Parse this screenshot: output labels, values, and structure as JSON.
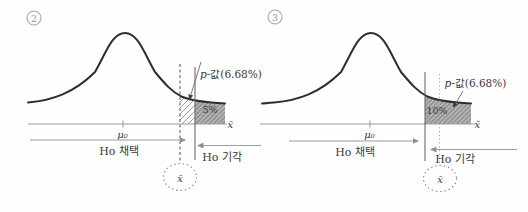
{
  "figure": {
    "colors": {
      "curve": "#2e2e2e",
      "axis_grey": "#9c9c9c",
      "region_fill_grey": "#b6b6b6",
      "region_hatch_dark": "#7c7c7c",
      "region_hatch_light": "#9b9b9b",
      "boundary_line": "#5f5f5f",
      "text_dark": "#3a3a3a",
      "badge_grey": "#9a9a9a"
    },
    "panels": [
      {
        "badge_number": "2",
        "p_value_label_prefix": "p",
        "p_value_label_suffix": "-값(6.68%)",
        "region_percent_label": "5%",
        "mean_label": "μ₀",
        "xbar_axis_label": "x̄",
        "xbar_sample_label": "x̄",
        "accept_label": "Ho 채택",
        "reject_label": "Ho 기각"
      },
      {
        "badge_number": "3",
        "p_value_label_prefix": "p",
        "p_value_label_suffix": "-값(6.68%)",
        "region_percent_label": "10%",
        "mean_label": "μ₀",
        "xbar_axis_label": "x̄",
        "xbar_sample_label": "x̄",
        "accept_label": "Ho 채택",
        "reject_label": "Ho 기각"
      }
    ]
  }
}
